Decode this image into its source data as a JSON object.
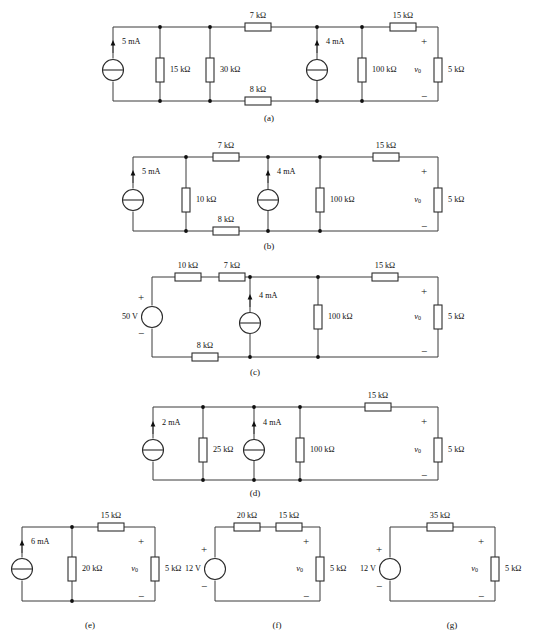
{
  "figure": {
    "background_color": "#ffffff",
    "line_color": "#3b3b3b",
    "text_color": "#111111",
    "units": {
      "resistance": "kΩ",
      "current": "mA",
      "voltage": "V"
    },
    "output_voltage_label": "v",
    "output_voltage_subscript": "0",
    "polarity_plus": "+",
    "polarity_minus": "−"
  },
  "circuits": [
    {
      "id": "a",
      "caption": "(a)",
      "caption_x": 269,
      "caption_y": 119,
      "frame": {
        "left": 113,
        "right": 438,
        "top": 27,
        "bottom": 101
      },
      "sources": [
        {
          "name": "current-source-5ma",
          "type": "current",
          "value": "5 mA",
          "x": 113,
          "y": 70,
          "r": 10.5,
          "arrow_dir": "up",
          "label_x": 122,
          "label_y": 42,
          "label_anchor": "start",
          "arrow_x": 113,
          "arrow_tip_y": 40,
          "arrow_tail_y": 53
        },
        {
          "name": "current-source-4ma",
          "type": "current",
          "value": "4 mA",
          "x": 317,
          "y": 70,
          "r": 10.5,
          "arrow_dir": "up",
          "label_x": 326,
          "label_y": 42,
          "label_anchor": "start",
          "arrow_x": 317,
          "arrow_tip_y": 40,
          "arrow_tail_y": 53
        }
      ],
      "resistors": [
        {
          "name": "resistor-15k-shunt",
          "value": "15 kΩ",
          "orientation": "v",
          "x": 160,
          "y": 70,
          "len": 24,
          "w": 8,
          "label_x": 170,
          "label_y": 70,
          "label_anchor": "start"
        },
        {
          "name": "resistor-30k-shunt",
          "value": "30 kΩ",
          "orientation": "v",
          "x": 210,
          "y": 70,
          "len": 24,
          "w": 8,
          "label_x": 220,
          "label_y": 70,
          "label_anchor": "start"
        },
        {
          "name": "resistor-7k-series",
          "value": "7 kΩ",
          "orientation": "h",
          "x": 258,
          "y": 27,
          "len": 26,
          "w": 8,
          "label_x": 258,
          "label_y": 16,
          "label_anchor": "middle"
        },
        {
          "name": "resistor-8k-series",
          "value": "8 kΩ",
          "orientation": "h",
          "x": 258,
          "y": 101,
          "len": 26,
          "w": 8,
          "label_x": 258,
          "label_y": 90,
          "label_anchor": "middle"
        },
        {
          "name": "resistor-100k-shunt",
          "value": "100 kΩ",
          "orientation": "v",
          "x": 362,
          "y": 70,
          "len": 24,
          "w": 8,
          "label_x": 372,
          "label_y": 70,
          "label_anchor": "start"
        },
        {
          "name": "resistor-15k-series",
          "value": "15 kΩ",
          "orientation": "h",
          "x": 403,
          "y": 27,
          "len": 26,
          "w": 8,
          "label_x": 403,
          "label_y": 16,
          "label_anchor": "middle"
        },
        {
          "name": "resistor-5k-load",
          "value": "5 kΩ",
          "orientation": "v",
          "x": 438,
          "y": 70,
          "len": 24,
          "w": 8,
          "label_x": 448,
          "label_y": 70,
          "label_anchor": "start"
        }
      ],
      "nodes": [
        {
          "x": 160,
          "y": 27
        },
        {
          "x": 210,
          "y": 27
        },
        {
          "x": 317,
          "y": 27
        },
        {
          "x": 362,
          "y": 27
        },
        {
          "x": 160,
          "y": 101
        },
        {
          "x": 210,
          "y": 101
        },
        {
          "x": 317,
          "y": 101
        },
        {
          "x": 362,
          "y": 101
        }
      ],
      "polarity": {
        "plus_x": 424,
        "plus_y": 42,
        "minus_x": 424,
        "minus_y": 97
      },
      "vo": {
        "x": 421,
        "y": 70,
        "anchor": "end"
      }
    },
    {
      "id": "b",
      "caption": "(b)",
      "caption_x": 269,
      "caption_y": 247,
      "frame": {
        "left": 133,
        "right": 438,
        "top": 157,
        "bottom": 231
      },
      "sources": [
        {
          "name": "current-source-5ma",
          "type": "current",
          "value": "5 mA",
          "x": 133,
          "y": 200,
          "r": 10.5,
          "arrow_dir": "up",
          "label_x": 142,
          "label_y": 172,
          "label_anchor": "start",
          "arrow_x": 133,
          "arrow_tip_y": 170,
          "arrow_tail_y": 183
        },
        {
          "name": "current-source-4ma",
          "type": "current",
          "value": "4 mA",
          "x": 268,
          "y": 200,
          "r": 10.5,
          "arrow_dir": "up",
          "label_x": 277,
          "label_y": 172,
          "label_anchor": "start",
          "arrow_x": 268,
          "arrow_tip_y": 170,
          "arrow_tail_y": 183
        }
      ],
      "resistors": [
        {
          "name": "resistor-10k-shunt",
          "value": "10 kΩ",
          "orientation": "v",
          "x": 186,
          "y": 200,
          "len": 24,
          "w": 8,
          "label_x": 196,
          "label_y": 200,
          "label_anchor": "start"
        },
        {
          "name": "resistor-7k-series",
          "value": "7 kΩ",
          "orientation": "h",
          "x": 226,
          "y": 157,
          "len": 26,
          "w": 8,
          "label_x": 226,
          "label_y": 146,
          "label_anchor": "middle"
        },
        {
          "name": "resistor-8k-series",
          "value": "8 kΩ",
          "orientation": "h",
          "x": 226,
          "y": 231,
          "len": 26,
          "w": 8,
          "label_x": 226,
          "label_y": 220,
          "label_anchor": "middle"
        },
        {
          "name": "resistor-100k-shunt",
          "value": "100 kΩ",
          "orientation": "v",
          "x": 320,
          "y": 200,
          "len": 24,
          "w": 8,
          "label_x": 330,
          "label_y": 200,
          "label_anchor": "start"
        },
        {
          "name": "resistor-15k-series",
          "value": "15 kΩ",
          "orientation": "h",
          "x": 386,
          "y": 157,
          "len": 26,
          "w": 8,
          "label_x": 386,
          "label_y": 146,
          "label_anchor": "middle"
        },
        {
          "name": "resistor-5k-load",
          "value": "5 kΩ",
          "orientation": "v",
          "x": 438,
          "y": 200,
          "len": 24,
          "w": 8,
          "label_x": 448,
          "label_y": 200,
          "label_anchor": "start"
        }
      ],
      "nodes": [
        {
          "x": 186,
          "y": 157
        },
        {
          "x": 268,
          "y": 157
        },
        {
          "x": 320,
          "y": 157
        },
        {
          "x": 186,
          "y": 231
        },
        {
          "x": 268,
          "y": 231
        },
        {
          "x": 320,
          "y": 231
        }
      ],
      "polarity": {
        "plus_x": 424,
        "plus_y": 172,
        "minus_x": 424,
        "minus_y": 227
      },
      "vo": {
        "x": 421,
        "y": 200,
        "anchor": "end"
      }
    },
    {
      "id": "c",
      "caption": "(c)",
      "caption_x": 255,
      "caption_y": 373,
      "frame": {
        "left": 152,
        "right": 438,
        "top": 277,
        "bottom": 357
      },
      "sources": [
        {
          "name": "voltage-source-50v",
          "type": "voltage",
          "value": "50 V",
          "x": 152,
          "y": 317,
          "r": 10.5,
          "label_x": 138,
          "label_y": 317,
          "label_anchor": "end",
          "plus_x": 141,
          "plus_y": 298,
          "minus_x": 141,
          "minus_y": 334
        },
        {
          "name": "current-source-4ma",
          "type": "current",
          "value": "4 mA",
          "x": 250,
          "y": 323,
          "r": 10.5,
          "arrow_dir": "up",
          "label_x": 259,
          "label_y": 296,
          "label_anchor": "start",
          "arrow_x": 250,
          "arrow_tip_y": 294,
          "arrow_tail_y": 307
        }
      ],
      "resistors": [
        {
          "name": "resistor-10k-series",
          "value": "10 kΩ",
          "orientation": "h",
          "x": 188,
          "y": 277,
          "len": 26,
          "w": 8,
          "label_x": 188,
          "label_y": 266,
          "label_anchor": "middle"
        },
        {
          "name": "resistor-7k-series",
          "value": "7 kΩ",
          "orientation": "h",
          "x": 232,
          "y": 277,
          "len": 26,
          "w": 8,
          "label_x": 232,
          "label_y": 266,
          "label_anchor": "middle"
        },
        {
          "name": "resistor-8k-series",
          "value": "8 kΩ",
          "orientation": "h",
          "x": 205,
          "y": 357,
          "len": 26,
          "w": 8,
          "label_x": 205,
          "label_y": 346,
          "label_anchor": "middle"
        },
        {
          "name": "resistor-100k-shunt",
          "value": "100 kΩ",
          "orientation": "v",
          "x": 318,
          "y": 317,
          "len": 24,
          "w": 8,
          "label_x": 328,
          "label_y": 317,
          "label_anchor": "start"
        },
        {
          "name": "resistor-15k-series",
          "value": "15 kΩ",
          "orientation": "h",
          "x": 385,
          "y": 277,
          "len": 26,
          "w": 8,
          "label_x": 385,
          "label_y": 266,
          "label_anchor": "middle"
        },
        {
          "name": "resistor-5k-load",
          "value": "5 kΩ",
          "orientation": "v",
          "x": 438,
          "y": 317,
          "len": 24,
          "w": 8,
          "label_x": 448,
          "label_y": 317,
          "label_anchor": "start"
        }
      ],
      "nodes": [
        {
          "x": 250,
          "y": 277
        },
        {
          "x": 318,
          "y": 277
        },
        {
          "x": 250,
          "y": 357
        },
        {
          "x": 318,
          "y": 357
        }
      ],
      "polarity": {
        "plus_x": 424,
        "plus_y": 292,
        "minus_x": 424,
        "minus_y": 352
      },
      "vo": {
        "x": 421,
        "y": 317,
        "anchor": "end"
      }
    },
    {
      "id": "d",
      "caption": "(d)",
      "caption_x": 255,
      "caption_y": 494,
      "frame": {
        "left": 153,
        "right": 438,
        "top": 407,
        "bottom": 480
      },
      "sources": [
        {
          "name": "current-source-2ma",
          "type": "current",
          "value": "2 mA",
          "x": 153,
          "y": 450,
          "r": 10.5,
          "arrow_dir": "up",
          "label_x": 162,
          "label_y": 423,
          "label_anchor": "start",
          "arrow_x": 153,
          "arrow_tip_y": 421,
          "arrow_tail_y": 434
        },
        {
          "name": "current-source-4ma",
          "type": "current",
          "value": "4 mA",
          "x": 254,
          "y": 450,
          "r": 10.5,
          "arrow_dir": "up",
          "label_x": 263,
          "label_y": 423,
          "label_anchor": "start",
          "arrow_x": 254,
          "arrow_tip_y": 421,
          "arrow_tail_y": 434
        }
      ],
      "resistors": [
        {
          "name": "resistor-25k-shunt",
          "value": "25 kΩ",
          "orientation": "v",
          "x": 203,
          "y": 450,
          "len": 24,
          "w": 8,
          "label_x": 213,
          "label_y": 450,
          "label_anchor": "start"
        },
        {
          "name": "resistor-100k-shunt",
          "value": "100 kΩ",
          "orientation": "v",
          "x": 300,
          "y": 450,
          "len": 24,
          "w": 8,
          "label_x": 310,
          "label_y": 450,
          "label_anchor": "start"
        },
        {
          "name": "resistor-15k-series",
          "value": "15 kΩ",
          "orientation": "h",
          "x": 378,
          "y": 407,
          "len": 26,
          "w": 8,
          "label_x": 378,
          "label_y": 396,
          "label_anchor": "middle"
        },
        {
          "name": "resistor-5k-load",
          "value": "5 kΩ",
          "orientation": "v",
          "x": 438,
          "y": 450,
          "len": 24,
          "w": 8,
          "label_x": 448,
          "label_y": 450,
          "label_anchor": "start"
        }
      ],
      "nodes": [
        {
          "x": 203,
          "y": 407
        },
        {
          "x": 254,
          "y": 407
        },
        {
          "x": 300,
          "y": 407
        },
        {
          "x": 203,
          "y": 480
        },
        {
          "x": 254,
          "y": 480
        },
        {
          "x": 300,
          "y": 480
        }
      ],
      "polarity": {
        "plus_x": 424,
        "plus_y": 422,
        "minus_x": 424,
        "minus_y": 476
      },
      "vo": {
        "x": 421,
        "y": 450,
        "anchor": "end"
      }
    },
    {
      "id": "e",
      "caption": "(e)",
      "caption_x": 90,
      "caption_y": 626,
      "frame": {
        "left": 22,
        "right": 155,
        "top": 527,
        "bottom": 601
      },
      "sources": [
        {
          "name": "current-source-6ma",
          "type": "current",
          "value": "6 mA",
          "x": 22,
          "y": 569,
          "r": 10.5,
          "arrow_dir": "up",
          "label_x": 31,
          "label_y": 542,
          "label_anchor": "start",
          "arrow_x": 22,
          "arrow_tip_y": 540,
          "arrow_tail_y": 553
        }
      ],
      "resistors": [
        {
          "name": "resistor-20k-shunt",
          "value": "20 kΩ",
          "orientation": "v",
          "x": 72,
          "y": 569,
          "len": 24,
          "w": 8,
          "label_x": 82,
          "label_y": 569,
          "label_anchor": "start"
        },
        {
          "name": "resistor-15k-series",
          "value": "15 kΩ",
          "orientation": "h",
          "x": 111,
          "y": 527,
          "len": 26,
          "w": 8,
          "label_x": 111,
          "label_y": 516,
          "label_anchor": "middle"
        },
        {
          "name": "resistor-5k-load",
          "value": "5 kΩ",
          "orientation": "v",
          "x": 155,
          "y": 569,
          "len": 24,
          "w": 8,
          "label_x": 165,
          "label_y": 569,
          "label_anchor": "start"
        }
      ],
      "nodes": [
        {
          "x": 72,
          "y": 527
        },
        {
          "x": 72,
          "y": 601
        }
      ],
      "polarity": {
        "plus_x": 141,
        "plus_y": 542,
        "minus_x": 141,
        "minus_y": 597
      },
      "vo": {
        "x": 138,
        "y": 569,
        "anchor": "end"
      }
    },
    {
      "id": "f",
      "caption": "(f)",
      "caption_x": 277,
      "caption_y": 626,
      "frame": {
        "left": 215,
        "right": 320,
        "top": 527,
        "bottom": 601
      },
      "sources": [
        {
          "name": "voltage-source-12v",
          "type": "voltage",
          "value": "12 V",
          "x": 215,
          "y": 569,
          "r": 10.5,
          "label_x": 201,
          "label_y": 569,
          "label_anchor": "end",
          "plus_x": 204,
          "plus_y": 550,
          "minus_x": 204,
          "minus_y": 587
        }
      ],
      "resistors": [
        {
          "name": "resistor-20k-series",
          "value": "20 kΩ",
          "orientation": "h",
          "x": 247,
          "y": 527,
          "len": 26,
          "w": 8,
          "label_x": 247,
          "label_y": 516,
          "label_anchor": "middle"
        },
        {
          "name": "resistor-15k-series",
          "value": "15 kΩ",
          "orientation": "h",
          "x": 289,
          "y": 527,
          "len": 26,
          "w": 8,
          "label_x": 289,
          "label_y": 516,
          "label_anchor": "middle"
        },
        {
          "name": "resistor-5k-load",
          "value": "5 kΩ",
          "orientation": "v",
          "x": 320,
          "y": 569,
          "len": 24,
          "w": 8,
          "label_x": 330,
          "label_y": 569,
          "label_anchor": "start"
        }
      ],
      "nodes": [],
      "polarity": {
        "plus_x": 306,
        "plus_y": 542,
        "minus_x": 306,
        "minus_y": 597
      },
      "vo": {
        "x": 303,
        "y": 569,
        "anchor": "end"
      }
    },
    {
      "id": "g",
      "caption": "(g)",
      "caption_x": 452,
      "caption_y": 626,
      "frame": {
        "left": 390,
        "right": 495,
        "top": 527,
        "bottom": 601
      },
      "sources": [
        {
          "name": "voltage-source-12v",
          "type": "voltage",
          "value": "12 V",
          "x": 390,
          "y": 569,
          "r": 10.5,
          "label_x": 376,
          "label_y": 569,
          "label_anchor": "end",
          "plus_x": 379,
          "plus_y": 550,
          "minus_x": 379,
          "minus_y": 587
        }
      ],
      "resistors": [
        {
          "name": "resistor-35k-series",
          "value": "35 kΩ",
          "orientation": "h",
          "x": 440,
          "y": 527,
          "len": 26,
          "w": 8,
          "label_x": 440,
          "label_y": 516,
          "label_anchor": "middle"
        },
        {
          "name": "resistor-5k-load",
          "value": "5 kΩ",
          "orientation": "v",
          "x": 495,
          "y": 569,
          "len": 24,
          "w": 8,
          "label_x": 505,
          "label_y": 569,
          "label_anchor": "start"
        }
      ],
      "nodes": [],
      "polarity": {
        "plus_x": 481,
        "plus_y": 542,
        "minus_x": 481,
        "minus_y": 597
      },
      "vo": {
        "x": 478,
        "y": 569,
        "anchor": "end"
      }
    }
  ]
}
